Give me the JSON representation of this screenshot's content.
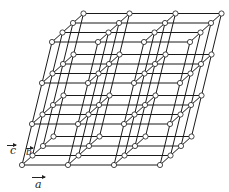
{
  "figure": {
    "title": "",
    "colors": {
      "line": "#1a1a1a",
      "node_fill": "#ffffff",
      "background": "#ffffff"
    }
  },
  "lattice": {
    "counts": {
      "a": 4,
      "b": 4,
      "c": 4
    },
    "origin": [
      22,
      165
    ],
    "step_a": [
      46,
      0
    ],
    "step_b": [
      10.5,
      -9.5
    ],
    "step_c": [
      10,
      -41
    ],
    "node_radius": 2.6
  },
  "vectors": {
    "a": {
      "label": "a",
      "arrow": "right"
    },
    "b": {
      "label": "b",
      "arrow": "right"
    },
    "c": {
      "label": "c",
      "arrow": "right"
    }
  }
}
